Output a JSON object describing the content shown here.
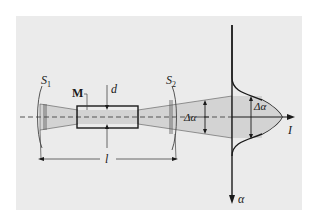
{
  "diagram": {
    "type": "optical-beam-divergence-schematic",
    "colors": {
      "panel_background": "#ebebeb",
      "beam_fill": "#d3d3d3",
      "stroke": "#1a1a1a",
      "axis_dash": "#555555"
    },
    "labels": {
      "slit1": "S",
      "slit1_sub": "1",
      "slit2": "S",
      "slit2_sub": "2",
      "medium": "M",
      "diameter": "d",
      "divergence_mid": "Δα",
      "divergence_peak": "Δα",
      "length": "l",
      "intensity_axis": "I",
      "angle_axis": "α"
    },
    "elements": [
      {
        "name": "slit-S1",
        "description": "aperture stop on left"
      },
      {
        "name": "medium-M",
        "description": "rectangular sample of diameter d"
      },
      {
        "name": "slit-S2",
        "description": "aperture stop on right"
      },
      {
        "name": "beam",
        "description": "shaded light beam converging into M and diverging after"
      },
      {
        "name": "intensity-profile",
        "description": "Gaussian intensity distribution I(α) with width Δα"
      },
      {
        "name": "length-dimension",
        "description": "distance l between S1 and S2"
      }
    ]
  }
}
